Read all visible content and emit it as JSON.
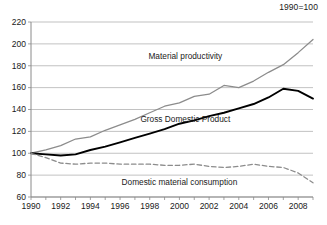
{
  "chart_data": {
    "type": "line",
    "title": "",
    "index_note": "1990=100",
    "xlabel": "",
    "ylabel": "",
    "xlim": [
      1990,
      2009
    ],
    "ylim": [
      60,
      220
    ],
    "grid": true,
    "legend_position": "inline-annotations",
    "x": [
      1990,
      1991,
      1992,
      1993,
      1994,
      1995,
      1996,
      1997,
      1998,
      1999,
      2000,
      2001,
      2002,
      2003,
      2004,
      2005,
      2006,
      2007,
      2008,
      2009
    ],
    "xticks": [
      1990,
      1992,
      1994,
      1996,
      1998,
      2000,
      2002,
      2004,
      2006,
      2008
    ],
    "xtick_labels": [
      "1990",
      "1992",
      "1994",
      "1996",
      "1998",
      "2000",
      "2002",
      "2004",
      "2006",
      "2008"
    ],
    "yticks": [
      60,
      80,
      100,
      120,
      140,
      160,
      180,
      200,
      220
    ],
    "ytick_labels": [
      "60",
      "80",
      "100",
      "120",
      "140",
      "160",
      "180",
      "200",
      "220"
    ],
    "series": [
      {
        "name": "Material productivity",
        "color": "#8c8c8c",
        "style": "solid",
        "label_text": "Material productivity",
        "values": [
          100,
          103,
          107,
          113,
          115,
          121,
          126,
          131,
          137,
          143,
          146,
          152,
          154,
          162,
          160,
          166,
          174,
          181,
          192,
          204
        ]
      },
      {
        "name": "Gross Domestic Product",
        "color": "#000000",
        "style": "solid",
        "label_text": "Gross Domestic Product",
        "values": [
          100,
          99,
          98,
          99,
          103,
          106,
          110,
          114,
          118,
          122,
          127,
          130,
          134,
          137,
          141,
          145,
          151,
          159,
          157,
          150
        ]
      },
      {
        "name": "Domestic material consumption",
        "color": "#8c8c8c",
        "style": "dashed",
        "label_text": "Domestic material consumption",
        "values": [
          100,
          96,
          91,
          90,
          91,
          91,
          90,
          90,
          90,
          89,
          89,
          90,
          88,
          87,
          88,
          90,
          88,
          87,
          82,
          73
        ]
      }
    ],
    "annotations": [
      {
        "text": "Material productivity",
        "x": 2000.4,
        "y": 186
      },
      {
        "text": "Gross Domestic Product",
        "x": 2000.4,
        "y": 129
      },
      {
        "text": "Domestic material consumption",
        "x": 2000.0,
        "y": 71
      }
    ]
  }
}
